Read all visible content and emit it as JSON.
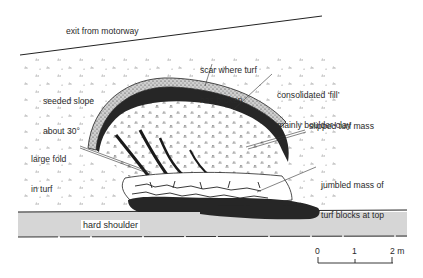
{
  "figure": {
    "type": "annotated-illustration",
    "labels": {
      "exit": "exit from motorway",
      "seeded_slope_line1": "seeded slope",
      "seeded_slope_line2": "about 30°",
      "scar_line1": "scar where turf",
      "scar_line2": "has broken",
      "fill_line1": "consolidated ‘fill’",
      "fill_line2": "mainly boulder-clay",
      "slipped": "slipped turf mass",
      "fold_line1": "large fold",
      "fold_line2": "in turf",
      "jumbled_line1": "jumbled mass of",
      "jumbled_line2": "turf blocks at top",
      "hard_shoulder": "hard shoulder"
    },
    "scale_bar": {
      "ticks": [
        "0",
        "1",
        "2 m"
      ],
      "unit": "m",
      "length_m": 2
    },
    "colors": {
      "ink": "#1a1a1a",
      "dark_fill": "#262626",
      "stipple_band": "#c9c9c9",
      "hard_shoulder": "#d6d6d6",
      "background": "#ffffff"
    }
  }
}
